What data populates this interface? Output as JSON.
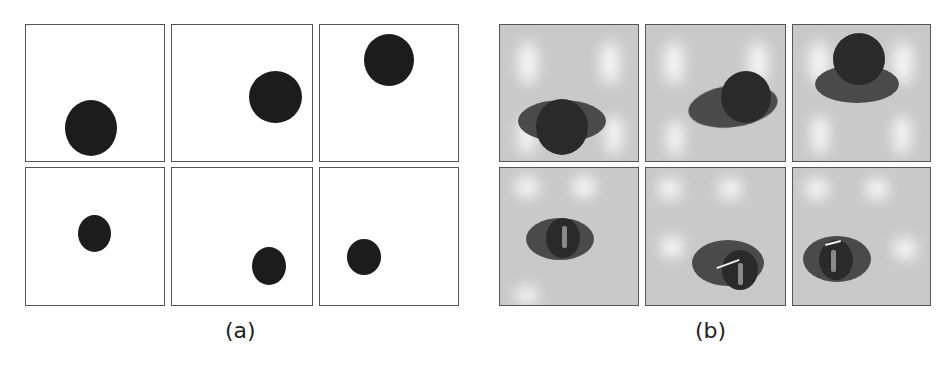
{
  "figure": {
    "panels": [
      {
        "caption": "(a)",
        "description": "binary segmentation masks",
        "cells": [
          {
            "row": 0,
            "col": 0
          },
          {
            "row": 0,
            "col": 1
          },
          {
            "row": 0,
            "col": 2
          },
          {
            "row": 1,
            "col": 0
          },
          {
            "row": 1,
            "col": 1
          },
          {
            "row": 1,
            "col": 2
          }
        ]
      },
      {
        "caption": "(b)",
        "description": "grayscale images of objects",
        "cells": [
          {
            "row": 0,
            "col": 0
          },
          {
            "row": 0,
            "col": 1
          },
          {
            "row": 0,
            "col": 2
          },
          {
            "row": 1,
            "col": 0
          },
          {
            "row": 1,
            "col": 1
          },
          {
            "row": 1,
            "col": 2
          }
        ]
      }
    ]
  }
}
